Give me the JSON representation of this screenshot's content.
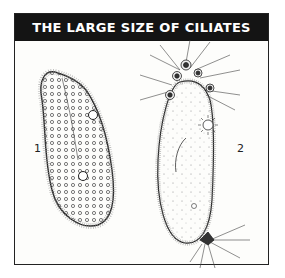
{
  "figure": {
    "title": "THE LARGE SIZE OF CILIATES",
    "labels": [
      {
        "id": "1",
        "text": "1"
      },
      {
        "id": "2",
        "text": "2"
      }
    ],
    "colors": {
      "header_bg": "#141414",
      "header_text": "#ffffff",
      "ink": "#222222"
    }
  }
}
